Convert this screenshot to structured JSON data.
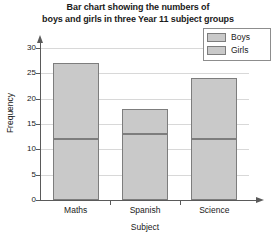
{
  "chart_data": {
    "type": "bar",
    "subtype": "stacked-bar",
    "title": "Bar chart showing the numbers of boys and girls in three Year 11 subject groups",
    "title_lines": [
      "Bar chart showing the numbers of",
      "boys and girls in three Year 11 subject groups"
    ],
    "xlabel": "Subject",
    "ylabel": "Frequency",
    "categories": [
      "Maths",
      "Spanish",
      "Science"
    ],
    "series": [
      {
        "name": "Boys",
        "values": [
          12,
          13,
          12
        ]
      },
      {
        "name": "Girls",
        "values": [
          15,
          5,
          12
        ]
      }
    ],
    "totals": [
      27,
      18,
      24
    ],
    "ylim": [
      0,
      30
    ],
    "ytick_labels": [
      "0",
      "5",
      "10",
      "15",
      "20",
      "25",
      "30"
    ],
    "ytick_values": [
      0,
      5,
      10,
      15,
      20,
      25,
      30
    ],
    "grid": true,
    "grid_axis": "y",
    "legend_position": "top-right",
    "colors": {
      "bar_fill": "#c9c9c9",
      "bar_border": "#7d7d7d",
      "gridline": "#d8d8d8",
      "axis": "#5a5a5a",
      "text": "#1a1a1a",
      "background": "#ffffff"
    }
  },
  "legend": {
    "entries": [
      {
        "label": "Boys"
      },
      {
        "label": "Girls"
      }
    ]
  }
}
